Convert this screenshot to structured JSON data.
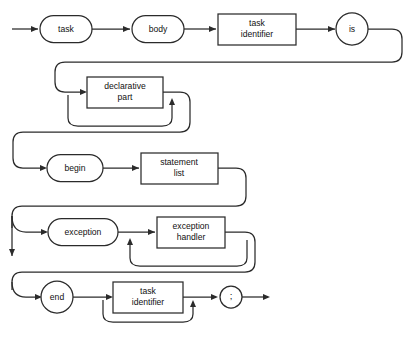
{
  "diagram": {
    "kind": "syntax-railroad-diagram",
    "title": "task body",
    "stroke_color": "#2b2b2b",
    "background_color": "#ffffff",
    "nodes": [
      {
        "id": "task",
        "label": "task",
        "shape": "oval"
      },
      {
        "id": "body",
        "label": "body",
        "shape": "oval"
      },
      {
        "id": "task_identifier",
        "label": "task\nidentifier",
        "line1": "task",
        "line2": "identifier",
        "shape": "box"
      },
      {
        "id": "is",
        "label": "is",
        "shape": "circle"
      },
      {
        "id": "declarative_part",
        "label": "declarative\npart",
        "line1": "declarative",
        "line2": "part",
        "shape": "box"
      },
      {
        "id": "begin",
        "label": "begin",
        "shape": "oval"
      },
      {
        "id": "statement_list",
        "label": "statement\nlist",
        "line1": "statement",
        "line2": "list",
        "shape": "box"
      },
      {
        "id": "exception",
        "label": "exception",
        "shape": "oval"
      },
      {
        "id": "exception_handler",
        "label": "exception\nhandler",
        "line1": "exception",
        "line2": "handler",
        "shape": "box"
      },
      {
        "id": "end",
        "label": "end",
        "shape": "circle"
      },
      {
        "id": "semicolon",
        "label": ";",
        "shape": "circle"
      },
      {
        "id": "task_identifier_end",
        "label": "task\nidentifier",
        "line1": "task",
        "line2": "identifier",
        "shape": "box"
      }
    ],
    "rows": [
      {
        "row": 1,
        "sequence": [
          "task",
          "body",
          "task identifier",
          "is"
        ]
      },
      {
        "row": 2,
        "sequence": [
          "declarative part"
        ],
        "repeatable": true,
        "optional": true
      },
      {
        "row": 3,
        "sequence": [
          "begin",
          "statement list"
        ]
      },
      {
        "row": 4,
        "sequence": [
          "exception",
          "exception handler"
        ],
        "repeatable": true,
        "optional": true
      },
      {
        "row": 5,
        "sequence": [
          "end",
          "task identifier",
          ";"
        ],
        "optional_item": "task identifier"
      }
    ]
  }
}
